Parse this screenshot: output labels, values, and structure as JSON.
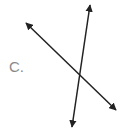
{
  "diagram": {
    "label": "C.",
    "lines": [
      {
        "name": "line-steep",
        "x1": 72,
        "y1": 127,
        "x2": 90,
        "y2": 5,
        "both_arrows": true
      },
      {
        "name": "line-diagonal",
        "x1": 26,
        "y1": 23,
        "x2": 116,
        "y2": 110,
        "both_arrows": true
      }
    ],
    "stroke_color": "#222222",
    "label_color": "#8a8a8a"
  }
}
